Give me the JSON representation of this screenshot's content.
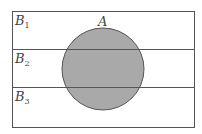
{
  "diagram": {
    "type": "venn-partition",
    "universe": {
      "x": 12,
      "y": 11,
      "width": 182,
      "height": 116
    },
    "set_A": {
      "label": "A",
      "cx": 103,
      "cy": 69,
      "r": 41,
      "fill": "#a9a9a9",
      "stroke": "#555555"
    },
    "partition_lines_y": [
      49,
      87
    ],
    "partitions": [
      {
        "label": "B",
        "sub": "1"
      },
      {
        "label": "B",
        "sub": "2"
      },
      {
        "label": "B",
        "sub": "3"
      }
    ],
    "stroke_color": "#555555"
  }
}
